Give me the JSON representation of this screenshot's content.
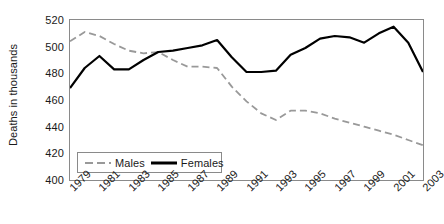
{
  "chart_data": {
    "type": "line",
    "title": "",
    "xlabel": "",
    "ylabel": "Deaths in thousands",
    "ylim": [
      400,
      520
    ],
    "ytick_values": [
      400,
      420,
      440,
      460,
      480,
      500,
      520
    ],
    "ytick_labels": [
      "400",
      "420",
      "440",
      "460",
      "480",
      "500",
      "520"
    ],
    "xlim": [
      1979,
      2003
    ],
    "xtick_labels": [
      "1979",
      "1981",
      "1983",
      "1985",
      "1987",
      "1989",
      "1991",
      "1993",
      "1995",
      "1997",
      "1999",
      "2001",
      "2003"
    ],
    "x": [
      1979,
      1980,
      1981,
      1982,
      1983,
      1984,
      1985,
      1986,
      1987,
      1988,
      1989,
      1990,
      1991,
      1992,
      1993,
      1994,
      1995,
      1996,
      1997,
      1998,
      1999,
      2000,
      2001,
      2002,
      2003
    ],
    "grid": false,
    "legend_position": "inside-bottom-left",
    "series": [
      {
        "name": "Males",
        "style": "dashed",
        "color": "#999999",
        "values": [
          504,
          511,
          508,
          502,
          497,
          495,
          496,
          490,
          485,
          485,
          484,
          470,
          459,
          450,
          445,
          452,
          452,
          450,
          446,
          443,
          440,
          437,
          434,
          430,
          426
        ]
      },
      {
        "name": "Females",
        "style": "solid",
        "color": "#000000",
        "values": [
          469,
          484,
          493,
          483,
          483,
          490,
          496,
          497,
          499,
          501,
          505,
          492,
          481,
          481,
          482,
          494,
          499,
          506,
          508,
          507,
          503,
          510,
          515,
          503,
          481
        ]
      }
    ]
  },
  "legend": {
    "items": [
      {
        "label": "Males",
        "swatch": "dashed-line-swatch"
      },
      {
        "label": "Females",
        "swatch": "solid-line-swatch"
      }
    ]
  },
  "colors": {
    "males": "#999999",
    "females": "#000000",
    "axis": "#8a8a8a",
    "text": "#1a1a1a",
    "background": "#ffffff"
  }
}
